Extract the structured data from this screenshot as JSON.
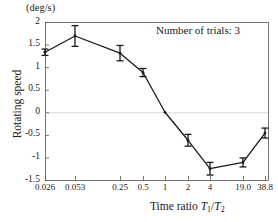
{
  "figure": {
    "unit_label": "(deg/s)",
    "annotation": "Number of trials: 3",
    "ylabel": "Rotating speed",
    "xlabel_prefix": "Time ratio ",
    "xlabel_num": "T",
    "xlabel_num_sub": "1",
    "xlabel_slash": "/",
    "xlabel_den": "T",
    "xlabel_den_sub": "2",
    "axis_color": "#555555",
    "line_color": "#1a1a1a",
    "grid_color": "#d8d8d8"
  },
  "chart_data": {
    "type": "line",
    "title": "",
    "subtitle": "",
    "xlabel": "Time ratio T1/T2",
    "ylabel": "Rotating speed",
    "unit": "deg/s",
    "annotation": "Number of trials: 3",
    "legend": [],
    "grid": "zero-line only",
    "xscale": "categorical (log-like ratio ticks)",
    "categories": [
      "0.026",
      "0.053",
      "0.25",
      "0.5",
      "1",
      "2",
      "4",
      "19.0",
      "38.8"
    ],
    "xtick_labels": [
      "0.026",
      "0.053",
      "0.25",
      "0.5",
      "1",
      "2",
      "4",
      "19.0",
      "38.8"
    ],
    "xtick_positions_px": [
      45,
      75,
      120,
      143,
      165,
      188,
      210,
      243,
      265
    ],
    "ytick_labels": [
      "2",
      "1.5",
      "1",
      "0.5",
      "0",
      "-0.5",
      "-1",
      "-1.5"
    ],
    "ytick_values": [
      2,
      1.5,
      1,
      0.5,
      0,
      -0.5,
      -1,
      -1.5
    ],
    "ylim": [
      -1.5,
      2
    ],
    "values": [
      1.33,
      1.69,
      1.31,
      0.88,
      0.0,
      -0.62,
      -1.25,
      -1.11,
      -0.46
    ],
    "errors": [
      0.07,
      0.23,
      0.17,
      0.09,
      0.0,
      0.13,
      0.14,
      0.1,
      0.11
    ],
    "series": [
      {
        "name": "Rotating speed",
        "values": [
          1.33,
          1.69,
          1.31,
          0.88,
          0.0,
          -0.62,
          -1.25,
          -1.11,
          -0.46
        ],
        "errors": [
          0.07,
          0.23,
          0.17,
          0.09,
          0.0,
          0.13,
          0.14,
          0.1,
          0.11
        ]
      }
    ]
  }
}
